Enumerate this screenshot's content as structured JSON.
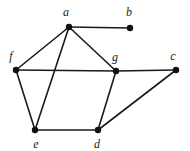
{
  "figure": {
    "background_color": "#ffffff",
    "width": 190,
    "height": 151
  },
  "chart_data": {
    "type": "diagram",
    "subtype": "undirected-graph",
    "title": "",
    "xlabel": "",
    "ylabel": "",
    "grid": false,
    "legend": null,
    "edge_color": "#1a1a1a",
    "node_color": "#111111",
    "node_radius": 3.2,
    "edge_width": 1.6,
    "nodes": [
      {
        "id": "a",
        "label": "a",
        "x": 69,
        "y": 27,
        "label_x": 66,
        "label_y": 12,
        "degree": 4
      },
      {
        "id": "b",
        "label": "b",
        "x": 130,
        "y": 28,
        "label_x": 129,
        "label_y": 12,
        "degree": 1
      },
      {
        "id": "c",
        "label": "c",
        "x": 176,
        "y": 70,
        "label_x": 173,
        "label_y": 56,
        "degree": 2
      },
      {
        "id": "d",
        "label": "d",
        "x": 98,
        "y": 130,
        "label_x": 97,
        "label_y": 144,
        "degree": 3
      },
      {
        "id": "e",
        "label": "e",
        "x": 35,
        "y": 130,
        "label_x": 36,
        "label_y": 144,
        "degree": 3
      },
      {
        "id": "f",
        "label": "f",
        "x": 16,
        "y": 70,
        "label_x": 11,
        "label_y": 56,
        "degree": 3
      },
      {
        "id": "g",
        "label": "g",
        "x": 116,
        "y": 71,
        "label_x": 115,
        "label_y": 57,
        "degree": 4
      }
    ],
    "edges": [
      {
        "id": "edge-a-b",
        "source": "a",
        "target": "b"
      },
      {
        "id": "edge-a-f",
        "source": "a",
        "target": "f"
      },
      {
        "id": "edge-a-g",
        "source": "a",
        "target": "g"
      },
      {
        "id": "edge-a-e",
        "source": "a",
        "target": "e"
      },
      {
        "id": "edge-f-g",
        "source": "f",
        "target": "g"
      },
      {
        "id": "edge-f-e",
        "source": "f",
        "target": "e"
      },
      {
        "id": "edge-e-d",
        "source": "e",
        "target": "d"
      },
      {
        "id": "edge-d-g",
        "source": "d",
        "target": "g"
      },
      {
        "id": "edge-d-c",
        "source": "d",
        "target": "c"
      },
      {
        "id": "edge-g-c",
        "source": "g",
        "target": "c"
      }
    ],
    "node_count": 7,
    "edge_count": 10
  }
}
